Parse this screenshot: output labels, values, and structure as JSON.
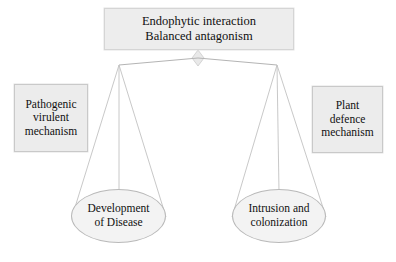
{
  "diagram": {
    "type": "balance-scale-concept-diagram",
    "title_box": {
      "id": "endophytic-interaction",
      "text": "Endophytic interaction\nBalanced antagonism",
      "line1": "Endophytic interaction",
      "line2": "Balanced antagonism",
      "shape": "rectangle",
      "fill": "#ededed",
      "stroke": "#d5d5d5"
    },
    "left_label_box": {
      "id": "pathogenic-virulent-mechanism",
      "text": "Pathogenic\nvirulent\nmechanism",
      "line1": "Pathogenic",
      "line2": "virulent",
      "line3": "mechanism",
      "shape": "rectangle",
      "fill": "#ececec",
      "stroke": "#c9c9c9"
    },
    "right_label_box": {
      "id": "plant-defence-mechanism",
      "text": "Plant\ndefence\nmechanism",
      "line1": "Plant",
      "line2": "defence",
      "line3": "mechanism",
      "shape": "rectangle",
      "fill": "#ececec",
      "stroke": "#c9c9c9"
    },
    "left_pan": {
      "id": "development-of-disease",
      "text": "Development\nof Disease",
      "line1": "Development",
      "line2": "of Disease",
      "shape": "ellipse",
      "fill": "#f3f3f3",
      "stroke": "#b9b9b9"
    },
    "right_pan": {
      "id": "intrusion-and-colonization",
      "text": "Intrusion and\ncolonization",
      "line1": "Intrusion and",
      "line2": "colonization",
      "shape": "ellipse",
      "fill": "#f3f3f3",
      "stroke": "#b9b9b9"
    },
    "fulcrum": {
      "id": "fulcrum-pivot",
      "shape": "diamond",
      "fill": "#e6e6e6",
      "stroke": "#cfcfcf"
    },
    "beam": {
      "id": "balance-beam",
      "stroke": "#b0b0b0",
      "left_end": [
        119,
        65
      ],
      "right_end": [
        277,
        65
      ]
    },
    "strings": {
      "stroke": "#c0c0c0",
      "left_anchor": [
        119,
        65
      ],
      "right_anchor": [
        277,
        65
      ],
      "left_targets": [
        [
          72,
          216
        ],
        [
          119,
          190
        ],
        [
          166,
          216
        ]
      ],
      "right_targets": [
        [
          232,
          216
        ],
        [
          279,
          190
        ],
        [
          326,
          216
        ]
      ]
    }
  }
}
